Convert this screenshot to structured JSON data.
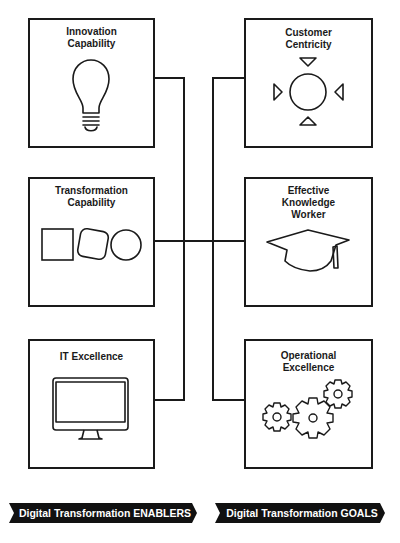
{
  "enablers": [
    {
      "title": "Innovation\nCapability",
      "icon": "lightbulb-icon"
    },
    {
      "title": "Transformation\nCapability",
      "icon": "shapes-icon"
    },
    {
      "title": "IT Excellence",
      "icon": "monitor-icon"
    }
  ],
  "goals": [
    {
      "title": "Customer\nCentricity",
      "icon": "circle-arrows-icon"
    },
    {
      "title": "Effective\nKnowledge\nWorker",
      "icon": "graduation-cap-icon"
    },
    {
      "title": "Operational\nExcellence",
      "icon": "gears-icon"
    }
  ],
  "banners": {
    "enablers_label": "Digital Transformation ENABLERS",
    "goals_label": "Digital Transformation GOALS"
  },
  "colors": {
    "line": "#1a1a1a",
    "banner_bg": "#111111",
    "banner_text": "#ffffff"
  }
}
